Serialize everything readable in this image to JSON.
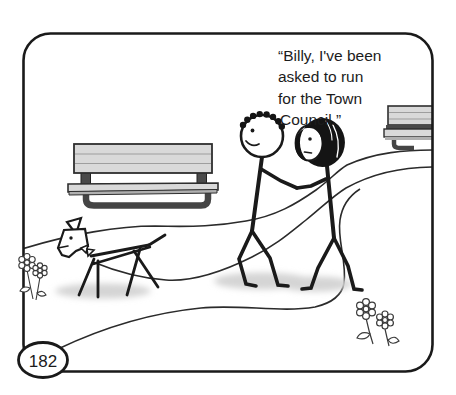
{
  "panel": {
    "number": "182",
    "background": "#ffffff",
    "border_color": "#1a1a1a"
  },
  "speech": {
    "lines": [
      "“Billy, I've been",
      "asked to run",
      "for the Town",
      "Council.”"
    ]
  },
  "scene": {
    "objects": [
      "winding-path",
      "park-bench-left",
      "park-bench-right-partial",
      "stick-man-billy",
      "stick-woman",
      "stick-dog",
      "flowers-left",
      "flowers-bottom-right",
      "page-number-badge"
    ],
    "colors": {
      "line_art": "#1a1a1a",
      "path_line": "#2b2b2b",
      "bench_light": "#d9d9d9",
      "bench_mid": "#b0b0b0",
      "bench_dark": "#454545",
      "hair_black": "#141414",
      "shadow": "#d4d4d4"
    }
  }
}
